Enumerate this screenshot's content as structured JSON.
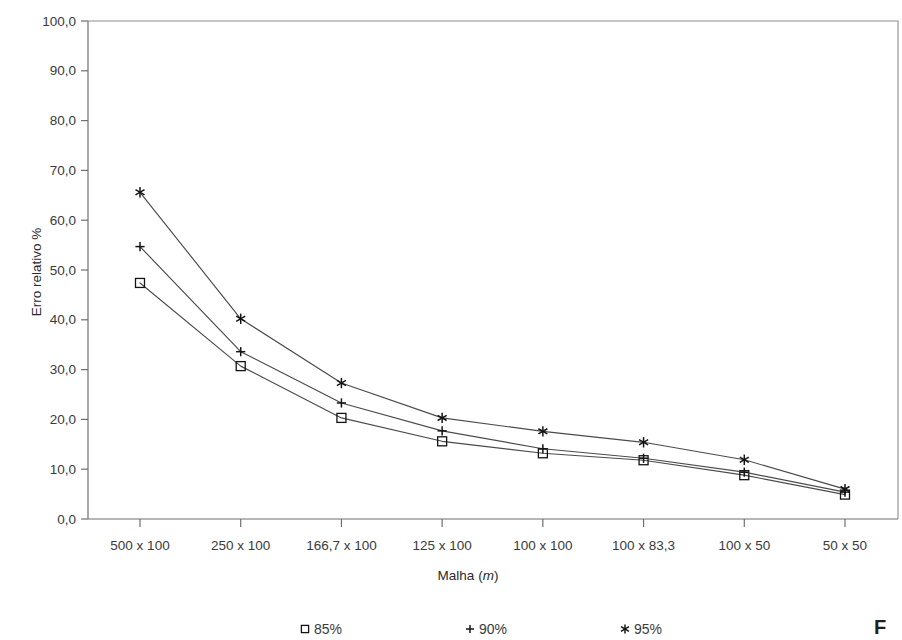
{
  "chart_data": {
    "type": "line",
    "title": "",
    "xlabel": "Malha (m)",
    "ylabel": "Erro relativo %",
    "categories": [
      "500 x 100",
      "250 x 100",
      "166,7 x 100",
      "125 x 100",
      "100 x 100",
      "100 x 83,3",
      "100 x 50",
      "50 x 50"
    ],
    "ylim": [
      0,
      100
    ],
    "ytick_labels": [
      "0,0",
      "10,0",
      "20,0",
      "30,0",
      "40,0",
      "50,0",
      "60,0",
      "70,0",
      "80,0",
      "90,0",
      "100,0"
    ],
    "ytick_values": [
      0,
      10,
      20,
      30,
      40,
      50,
      60,
      70,
      80,
      90,
      100
    ],
    "grid": false,
    "legend_position": "bottom",
    "series": [
      {
        "name": "85%",
        "marker": "square",
        "values": [
          47.4,
          30.7,
          20.3,
          15.6,
          13.2,
          11.8,
          8.8,
          4.9
        ]
      },
      {
        "name": "90%",
        "marker": "plus",
        "values": [
          54.7,
          33.6,
          23.3,
          17.7,
          14.1,
          12.2,
          9.4,
          5.4
        ]
      },
      {
        "name": "95%",
        "marker": "star",
        "values": [
          65.6,
          40.2,
          27.3,
          20.3,
          17.6,
          15.4,
          11.9,
          6.0
        ]
      }
    ]
  },
  "legend": {
    "items": [
      {
        "symbol": "square",
        "label": "85%"
      },
      {
        "symbol": "plus",
        "label": "90%"
      },
      {
        "symbol": "star",
        "label": "95%"
      }
    ]
  },
  "caption": {
    "partial_text": "F"
  }
}
